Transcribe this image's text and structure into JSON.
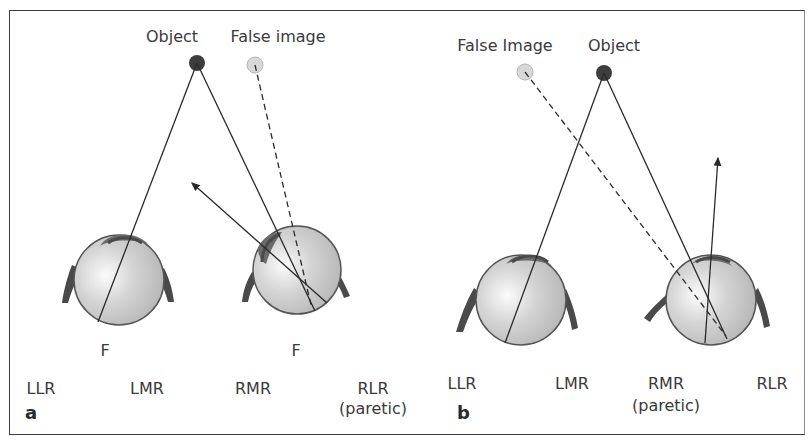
{
  "figure": {
    "panels": [
      {
        "letter": "a",
        "object_label": "Object",
        "false_image_label": "False image",
        "fixation_labels": [
          "F",
          "F"
        ],
        "muscle_labels": {
          "llr": "LLR",
          "lmr": "LMR",
          "rmr": "RMR",
          "rlr": "RLR",
          "rlr_note": "(paretic)"
        }
      },
      {
        "letter": "b",
        "object_label": "Object",
        "false_image_label": "False Image",
        "muscle_labels": {
          "llr": "LLR",
          "lmr": "LMR",
          "rmr": "RMR",
          "rmr_note": "(paretic)",
          "rlr": "RLR"
        }
      }
    ],
    "colors": {
      "object": "#3d3d3d",
      "false_image": "#d8d8d8",
      "eyeball": "#c9c9c9",
      "muscle": "#4a4a4a",
      "line": "#2a2a2a",
      "frame": "#3c3c3c"
    }
  }
}
